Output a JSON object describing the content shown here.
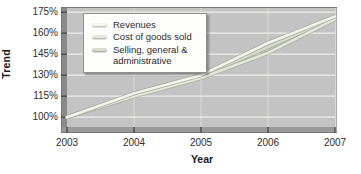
{
  "figure": {
    "y_axis_title": "Trend",
    "x_axis_title": "Year"
  },
  "legend": {
    "position": "upper left",
    "items": [
      {
        "label": "Revenues",
        "color": "#f4f4ee"
      },
      {
        "label": "Cost of goods sold",
        "color": "#e4e8d9"
      },
      {
        "label": "Selling, general & administrative",
        "color": "#d6dbcc"
      }
    ]
  },
  "chart_data": {
    "type": "line",
    "x": [
      2003,
      2004,
      2005,
      2006,
      2007
    ],
    "series": [
      {
        "name": "Revenues",
        "color": "#f4f4ee",
        "values": [
          100,
          117,
          130,
          153,
          172
        ]
      },
      {
        "name": "Cost of goods sold",
        "color": "#e4e8d9",
        "values": [
          100,
          115,
          128,
          146,
          170
        ]
      },
      {
        "name": "Selling, general & administrative",
        "color": "#d6dbcc",
        "values": [
          100,
          116,
          129,
          150,
          171
        ]
      }
    ],
    "title": "",
    "xlabel": "Year",
    "ylabel": "Trend",
    "ylim": [
      93,
      178
    ],
    "yticks": [
      100,
      115,
      130,
      145,
      160,
      175
    ],
    "ytick_suffix": "%",
    "grid": true,
    "plot_bg_color": "#c3c3c3",
    "gridline_color": "#eeeeea",
    "bevel_dark_color": "#8a8a8a",
    "bevel_bottom_color": "#999999",
    "tick_color": "#4a4a4a",
    "line_shadow_color": "#a4a99b"
  }
}
